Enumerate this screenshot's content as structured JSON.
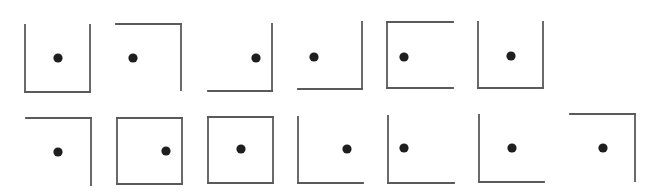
{
  "diagram": {
    "type": "figure-sequence",
    "rows": 2,
    "style": {
      "line_color": "#5a5a5a",
      "line_width": 1.8,
      "dot_color": "#1e1e1e",
      "dot_radius": 4.6,
      "background": "#ffffff"
    },
    "figures": [
      {
        "id": 1,
        "row": 1,
        "x1": 25,
        "y1": 25,
        "x2": 90,
        "y2": 92,
        "sides": [
          "left",
          "right",
          "bottom"
        ],
        "dot": [
          58,
          58
        ]
      },
      {
        "id": 2,
        "row": 1,
        "x1": 116,
        "y1": 24,
        "x2": 181,
        "y2": 90,
        "sides": [
          "top",
          "right"
        ],
        "dot": [
          133,
          58
        ]
      },
      {
        "id": 3,
        "row": 1,
        "x1": 208,
        "y1": 24,
        "x2": 272,
        "y2": 91,
        "sides": [
          "right",
          "bottom"
        ],
        "dot": [
          256,
          58
        ]
      },
      {
        "id": 4,
        "row": 1,
        "x1": 298,
        "y1": 22,
        "x2": 362,
        "y2": 89,
        "sides": [
          "right",
          "bottom"
        ],
        "dot": [
          314,
          57
        ]
      },
      {
        "id": 5,
        "row": 1,
        "x1": 387,
        "y1": 22,
        "x2": 453,
        "y2": 88,
        "sides": [
          "top",
          "left",
          "bottom"
        ],
        "dot": [
          404,
          57
        ]
      },
      {
        "id": 6,
        "row": 1,
        "x1": 478,
        "y1": 22,
        "x2": 543,
        "y2": 88,
        "sides": [
          "left",
          "right",
          "bottom"
        ],
        "dot": [
          511,
          56
        ]
      },
      {
        "id": 7,
        "row": 2,
        "x1": 26,
        "y1": 118,
        "x2": 91,
        "y2": 185,
        "sides": [
          "top",
          "right"
        ],
        "dot": [
          58,
          152
        ]
      },
      {
        "id": 8,
        "row": 2,
        "x1": 117,
        "y1": 118,
        "x2": 182,
        "y2": 184,
        "sides": [
          "top",
          "right",
          "bottom",
          "left"
        ],
        "dot": [
          166,
          151
        ]
      },
      {
        "id": 9,
        "row": 2,
        "x1": 208,
        "y1": 117,
        "x2": 273,
        "y2": 183,
        "sides": [
          "top",
          "right",
          "bottom",
          "left"
        ],
        "dot": [
          241,
          149
        ]
      },
      {
        "id": 10,
        "row": 2,
        "x1": 298,
        "y1": 117,
        "x2": 363,
        "y2": 183,
        "sides": [
          "left",
          "bottom"
        ],
        "dot": [
          347,
          149
        ]
      },
      {
        "id": 11,
        "row": 2,
        "x1": 388,
        "y1": 116,
        "x2": 454,
        "y2": 183,
        "sides": [
          "left",
          "bottom"
        ],
        "dot": [
          404,
          148
        ]
      },
      {
        "id": 12,
        "row": 2,
        "x1": 479,
        "y1": 115,
        "x2": 544,
        "y2": 182,
        "sides": [
          "left",
          "bottom"
        ],
        "dot": [
          512,
          148
        ]
      },
      {
        "id": 13,
        "row": 2,
        "x1": 570,
        "y1": 114,
        "x2": 635,
        "y2": 181,
        "sides": [
          "top",
          "right"
        ],
        "dot": [
          603,
          148
        ]
      }
    ]
  }
}
